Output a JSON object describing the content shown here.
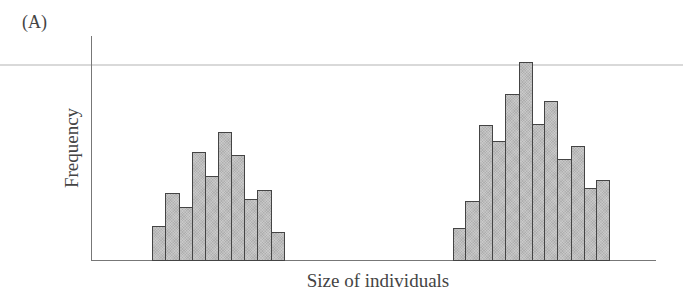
{
  "panel_label": "(A)",
  "chart_data": {
    "type": "bar",
    "title": "",
    "xlabel": "Size of individuals",
    "ylabel": "Frequency",
    "grid": false,
    "legend": null,
    "note": "Bimodal histogram with no numeric tick labels; values are relative bar heights in pixels.",
    "series": [
      {
        "name": "Smaller mode",
        "values": [
          35,
          68,
          54,
          109,
          85,
          129,
          106,
          62,
          71,
          29
        ]
      },
      {
        "name": "Larger mode",
        "values": [
          33,
          60,
          136,
          120,
          167,
          199,
          137,
          160,
          102,
          115,
          73,
          81
        ]
      }
    ],
    "bars": [
      {
        "x": 152,
        "w": 13,
        "h": 35
      },
      {
        "x": 165,
        "w": 14,
        "h": 68
      },
      {
        "x": 179,
        "w": 13,
        "h": 54
      },
      {
        "x": 192,
        "w": 13,
        "h": 109
      },
      {
        "x": 205,
        "w": 13,
        "h": 85
      },
      {
        "x": 218,
        "w": 13,
        "h": 129
      },
      {
        "x": 231,
        "w": 13,
        "h": 106
      },
      {
        "x": 244,
        "w": 13,
        "h": 62
      },
      {
        "x": 257,
        "w": 14,
        "h": 71
      },
      {
        "x": 271,
        "w": 13,
        "h": 29
      },
      {
        "x": 453,
        "w": 12,
        "h": 33
      },
      {
        "x": 465,
        "w": 14,
        "h": 60
      },
      {
        "x": 479,
        "w": 13,
        "h": 136
      },
      {
        "x": 492,
        "w": 13,
        "h": 120
      },
      {
        "x": 505,
        "w": 14,
        "h": 167
      },
      {
        "x": 519,
        "w": 13,
        "h": 199
      },
      {
        "x": 532,
        "w": 12,
        "h": 137
      },
      {
        "x": 544,
        "w": 13,
        "h": 160
      },
      {
        "x": 557,
        "w": 14,
        "h": 102
      },
      {
        "x": 571,
        "w": 13,
        "h": 115
      },
      {
        "x": 584,
        "w": 12,
        "h": 73
      },
      {
        "x": 596,
        "w": 13,
        "h": 81
      }
    ],
    "colors": {
      "bar_fill": "#bdbdbd",
      "bar_edge": "#444444",
      "axis": "#777777",
      "guide_line": "#d9d9d9"
    }
  }
}
